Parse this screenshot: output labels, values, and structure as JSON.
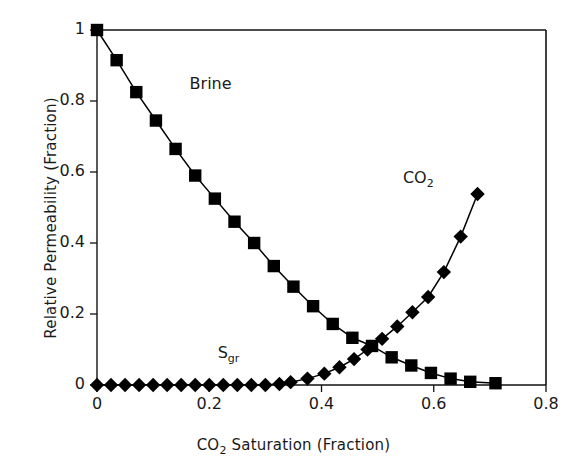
{
  "chart_data": {
    "type": "line",
    "title": "",
    "xlabel": "CO₂ Saturation (Fraction)",
    "ylabel": "Relative Permeability (Fraction)",
    "xlim": [
      0,
      0.8
    ],
    "ylim": [
      0,
      1
    ],
    "xticks": [
      "0",
      "0.2",
      "0.4",
      "0.6",
      "0.8"
    ],
    "xtick_values": [
      0,
      0.2,
      0.4,
      0.6,
      0.8
    ],
    "yticks": [
      "0",
      "0.2",
      "0.4",
      "0.6",
      "0.8",
      "1"
    ],
    "ytick_values": [
      0,
      0.2,
      0.4,
      0.6,
      0.8,
      1
    ],
    "grid": false,
    "legend_position": "inline-annotations",
    "annotations": [
      {
        "name": "brine-label",
        "text": "Brine",
        "x": 0.165,
        "y": 0.845
      },
      {
        "name": "co2-label",
        "text": "CO2",
        "base": "CO",
        "sub": "2",
        "x": 0.545,
        "y": 0.58
      },
      {
        "name": "sgr-label",
        "text": "Sgr",
        "base": "S",
        "sub": "gr",
        "x": 0.215,
        "y": 0.088
      }
    ],
    "series": [
      {
        "name": "Brine",
        "marker": "square",
        "color": "#000000",
        "points": [
          [
            0.0,
            1.0
          ],
          [
            0.035,
            0.915
          ],
          [
            0.07,
            0.825
          ],
          [
            0.105,
            0.745
          ],
          [
            0.14,
            0.665
          ],
          [
            0.175,
            0.59
          ],
          [
            0.21,
            0.525
          ],
          [
            0.245,
            0.46
          ],
          [
            0.28,
            0.4
          ],
          [
            0.315,
            0.335
          ],
          [
            0.35,
            0.277
          ],
          [
            0.385,
            0.222
          ],
          [
            0.42,
            0.172
          ],
          [
            0.455,
            0.133
          ],
          [
            0.49,
            0.11
          ],
          [
            0.525,
            0.078
          ],
          [
            0.56,
            0.055
          ],
          [
            0.595,
            0.034
          ],
          [
            0.63,
            0.018
          ],
          [
            0.665,
            0.009
          ],
          [
            0.71,
            0.005
          ]
        ]
      },
      {
        "name": "CO2",
        "marker": "diamond",
        "color": "#000000",
        "points": [
          [
            0.345,
            0.008
          ],
          [
            0.375,
            0.018
          ],
          [
            0.405,
            0.032
          ],
          [
            0.432,
            0.05
          ],
          [
            0.458,
            0.073
          ],
          [
            0.482,
            0.1
          ],
          [
            0.508,
            0.13
          ],
          [
            0.535,
            0.165
          ],
          [
            0.562,
            0.205
          ],
          [
            0.59,
            0.248
          ],
          [
            0.618,
            0.318
          ],
          [
            0.648,
            0.418
          ],
          [
            0.678,
            0.538
          ]
        ]
      },
      {
        "name": "Sgr",
        "marker": "diamond",
        "color": "#000000",
        "points": [
          [
            0.0,
            0.0
          ],
          [
            0.025,
            0.0
          ],
          [
            0.05,
            0.0
          ],
          [
            0.075,
            0.0
          ],
          [
            0.1,
            0.0
          ],
          [
            0.125,
            0.0
          ],
          [
            0.15,
            0.0
          ],
          [
            0.175,
            0.0
          ],
          [
            0.2,
            0.0
          ],
          [
            0.225,
            0.0
          ],
          [
            0.25,
            0.0
          ],
          [
            0.275,
            0.0
          ],
          [
            0.3,
            0.0
          ],
          [
            0.325,
            0.003
          ]
        ]
      }
    ]
  },
  "axes": {
    "x_title": "CO2 Saturation (Fraction)",
    "x_title_base": "CO",
    "x_title_sub": "2",
    "x_title_rest": " Saturation (Fraction)",
    "y_title": "Relative Permeability (Fraction)"
  }
}
